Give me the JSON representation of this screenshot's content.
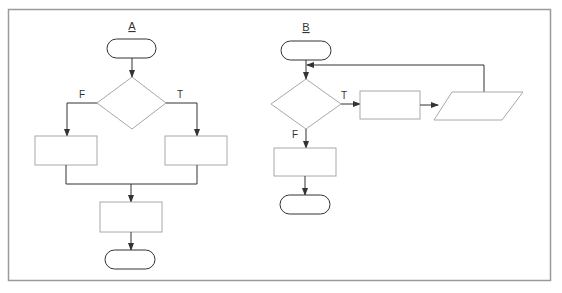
{
  "figure": {
    "frame_color": "#9a9a9a",
    "shape_stroke": "#a8a8a8",
    "connector_color": "#333333"
  },
  "diagram_a": {
    "title": "A",
    "branch_false_label": "F",
    "branch_true_label": "T",
    "shapes": [
      "start-terminal",
      "decision",
      "false-process",
      "true-process",
      "merge-process",
      "end-terminal"
    ]
  },
  "diagram_b": {
    "title": "B",
    "branch_true_label": "T",
    "branch_false_label": "F",
    "shapes": [
      "start-terminal",
      "decision",
      "loop-process",
      "loop-io",
      "exit-process",
      "end-terminal"
    ]
  }
}
